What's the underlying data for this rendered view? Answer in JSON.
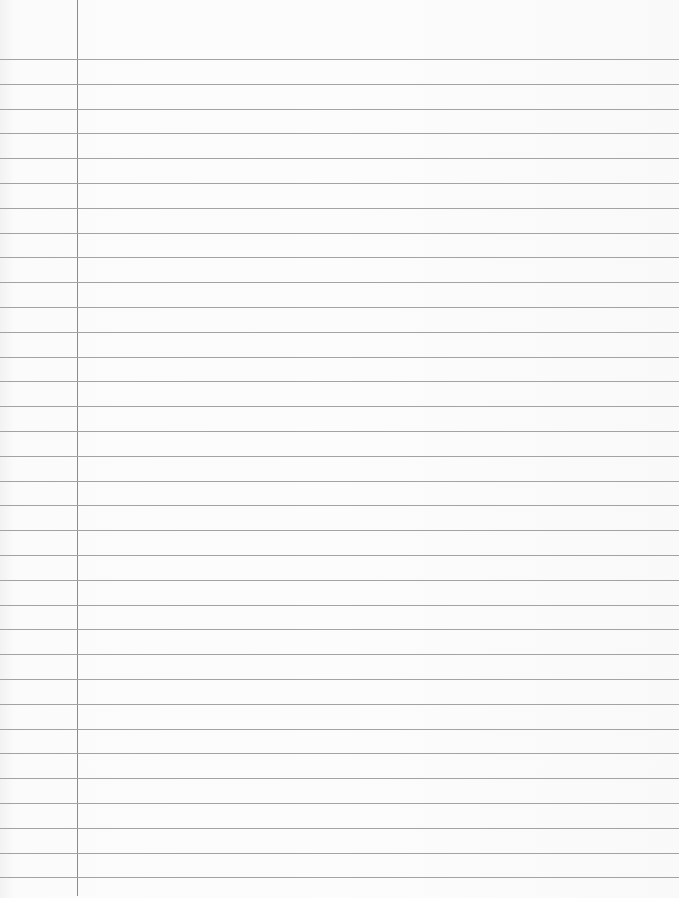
{
  "page": {
    "type": "lined-notebook-paper",
    "colors": {
      "paper": "#fbfbfb",
      "rule_line": "#a3a3a3",
      "margin_line": "#8c8c8c"
    },
    "margin_line_x": 77,
    "first_rule_y": 59,
    "rule_spacing": 24.8,
    "rule_count": 34
  }
}
